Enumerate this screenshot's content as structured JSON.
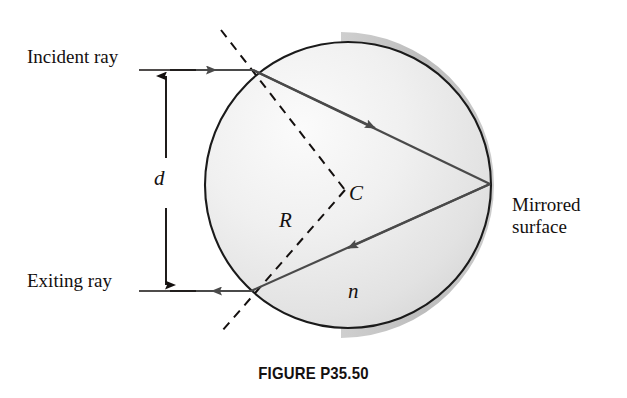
{
  "figure": {
    "caption": "FIGURE P35.50",
    "labels": {
      "incident_ray": "Incident ray",
      "exiting_ray": "Exiting ray",
      "mirrored_surface": "Mirrored surface",
      "distance": "d",
      "center": "C",
      "radius": "R",
      "index_of_refraction": "n"
    },
    "colors": {
      "outline": "#1a1a1a",
      "sphere_fill_light": "#f2f2f2",
      "sphere_fill_dark": "#d8d8d8",
      "mirror_band": "#b5b5b5",
      "ray": "#4a4a4a",
      "text": "#14100f",
      "background": "#ffffff"
    },
    "geometry": {
      "sphere_center_x": 348,
      "sphere_center_y": 185,
      "sphere_radius": 143,
      "entry_point_x": 253,
      "entry_point_y": 70,
      "reflection_point_x": 490,
      "reflection_point_y": 184,
      "exit_point_x": 251,
      "exit_point_y": 291,
      "incident_ray_y": 70,
      "exiting_ray_y": 291,
      "ray_start_x": 170,
      "dimension_arrow_x": 166
    }
  }
}
